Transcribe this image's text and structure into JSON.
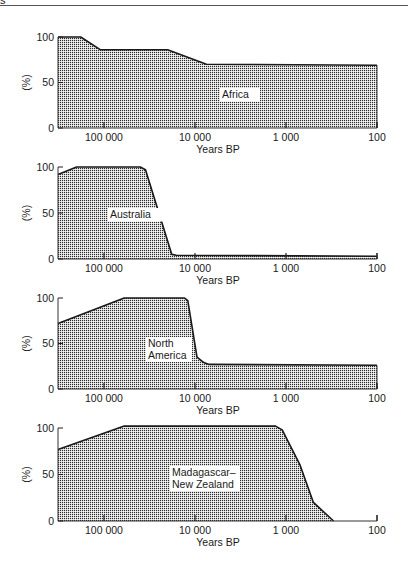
{
  "header": {
    "glyph": "s"
  },
  "chart_data": [
    {
      "type": "area",
      "title": "Africa",
      "xlabel": "Years BP",
      "ylabel": "(%)",
      "xscale": "log",
      "xlim": [
        320000,
        100
      ],
      "ylim": [
        0,
        100
      ],
      "xticks": [
        100000,
        10000,
        1000,
        100
      ],
      "xtick_labels": [
        "100 000",
        "10 000",
        "1 000",
        "100"
      ],
      "yticks": [
        0,
        50,
        100
      ],
      "ytick_labels": [
        "0",
        "50",
        "100"
      ],
      "x": [
        320000,
        180000,
        110000,
        20000,
        7500,
        100
      ],
      "values": [
        100,
        100,
        86,
        86,
        70,
        69
      ],
      "label_pos": [
        222,
        98
      ]
    },
    {
      "type": "area",
      "title": "Australia",
      "xlabel": "Years BP",
      "ylabel": "(%)",
      "xscale": "log",
      "xlim": [
        320000,
        100
      ],
      "ylim": [
        0,
        100
      ],
      "xticks": [
        100000,
        10000,
        1000,
        100
      ],
      "xtick_labels": [
        "100 000",
        "10 000",
        "1 000",
        "100"
      ],
      "yticks": [
        0,
        50,
        100
      ],
      "ytick_labels": [
        "0",
        "50",
        "100"
      ],
      "x": [
        320000,
        200000,
        40000,
        35000,
        18000,
        16000,
        100
      ],
      "values": [
        92,
        100,
        100,
        97,
        5,
        4,
        3
      ],
      "label_pos": [
        110,
        218
      ]
    },
    {
      "type": "area",
      "title": "North America",
      "xlabel": "Years BP",
      "ylabel": "(%)",
      "xscale": "log",
      "xlim": [
        320000,
        100
      ],
      "ylim": [
        0,
        100
      ],
      "xticks": [
        100000,
        10000,
        1000,
        100
      ],
      "xtick_labels": [
        "100 000",
        "10 000",
        "1 000",
        "100"
      ],
      "yticks": [
        0,
        50,
        100
      ],
      "ytick_labels": [
        "0",
        "50",
        "100"
      ],
      "x": [
        320000,
        60000,
        13000,
        12000,
        9500,
        8000,
        7000,
        100
      ],
      "values": [
        72,
        100,
        100,
        97,
        35,
        29,
        27,
        26
      ],
      "label_pos": [
        148,
        347
      ]
    },
    {
      "type": "area",
      "title": "Madagascar– New Zealand",
      "xlabel": "Years BP",
      "ylabel": "(%)",
      "xscale": "log",
      "xlim": [
        320000,
        100
      ],
      "ylim": [
        0,
        100
      ],
      "xticks": [
        100000,
        10000,
        1000,
        100
      ],
      "xtick_labels": [
        "100 000",
        "10 000",
        "1 000",
        "100"
      ],
      "yticks": [
        0,
        50,
        100
      ],
      "ytick_labels": [
        "0",
        "50",
        "100"
      ],
      "x": [
        320000,
        60000,
        1300,
        1100,
        700,
        500,
        300
      ],
      "values": [
        77,
        102,
        102,
        98,
        60,
        20,
        0
      ],
      "label_pos": [
        172,
        476
      ]
    }
  ],
  "panels": [
    {
      "label_lines": [
        "Africa"
      ],
      "top": 37,
      "bottom": 128
    },
    {
      "label_lines": [
        "Australia"
      ],
      "top": 167,
      "bottom": 259
    },
    {
      "label_lines": [
        "North",
        "America"
      ],
      "top": 298,
      "bottom": 389
    },
    {
      "label_lines": [
        "Madagascar–",
        "New Zealand"
      ],
      "top": 428,
      "bottom": 521
    }
  ],
  "colors": {
    "fill_dot": "#2b2b2b",
    "fill_bg": "#ffffff",
    "line": "#1a1a1a"
  }
}
